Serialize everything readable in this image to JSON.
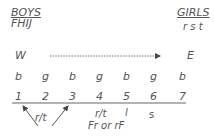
{
  "boys": {
    "title": "BOYS",
    "names": "FHIJ"
  },
  "girls": {
    "title": "GIRLS",
    "names": "r s t"
  },
  "direction": {
    "west": "W",
    "east": "E"
  },
  "seats": {
    "genders": [
      "b",
      "g",
      "b",
      "g",
      "b",
      "g",
      "b"
    ],
    "numbers": [
      "1",
      "2",
      "3",
      "4",
      "5",
      "6",
      "7"
    ]
  },
  "annotations": {
    "arrow_label": "r/t",
    "seat4_top": "r/t",
    "seat4_bottom": "Fr or rF",
    "seat5": "l",
    "seat6": "s"
  },
  "colors": {
    "ink": "#555555",
    "background": "#ffffff"
  }
}
